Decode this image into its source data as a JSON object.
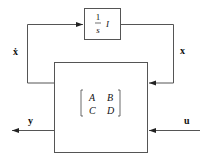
{
  "diagram": {
    "integrator_block": {
      "numerator": "1",
      "denominator": "s",
      "operator": "I"
    },
    "state_space_block": {
      "matrix": [
        [
          "A",
          "B"
        ],
        [
          "C",
          "D"
        ]
      ]
    },
    "signals": {
      "state_derivative": "ẋ",
      "state": "x",
      "output": "y",
      "input": "u"
    },
    "colors": {
      "line": "#444444",
      "text": "#111111"
    }
  }
}
